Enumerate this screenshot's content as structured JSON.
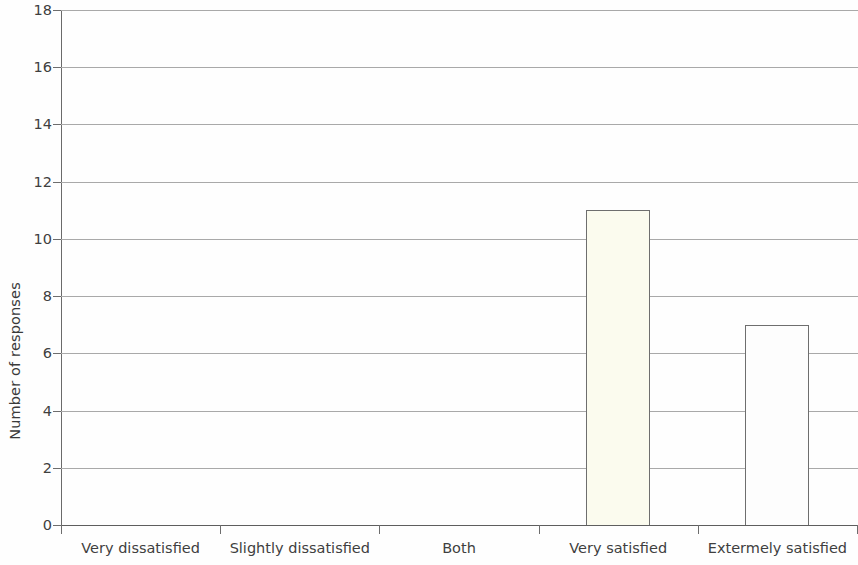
{
  "chart_data": {
    "type": "bar",
    "title": "",
    "xlabel": "",
    "ylabel": "Number of responses",
    "categories": [
      "Very dissatisfied",
      "Slightly dissatisfied",
      "Both",
      "Very satisfied",
      "Extermely satisfied"
    ],
    "values": [
      0,
      0,
      0,
      11,
      7
    ],
    "ylim": [
      0,
      18
    ],
    "ytick_step": 2,
    "yticks": [
      0,
      2,
      4,
      6,
      8,
      10,
      12,
      14,
      16,
      18
    ],
    "ytick_labels": [
      "0",
      "2",
      "4",
      "6",
      "8",
      "10",
      "12",
      "14",
      "16",
      "18"
    ],
    "grid": true,
    "legend": false,
    "legend_position": "none",
    "bar_colors": [
      "#fbfbee",
      "#fbfbee",
      "#fbfbee",
      "#fbfbee",
      "#fdfdfd"
    ],
    "bar_edge_color": "#6e6e6e",
    "gridline_color": "#a9a9a9",
    "axis_color": "#6a6a6a",
    "text_color": "#3f3f3f",
    "background_color": "#fefefe"
  }
}
